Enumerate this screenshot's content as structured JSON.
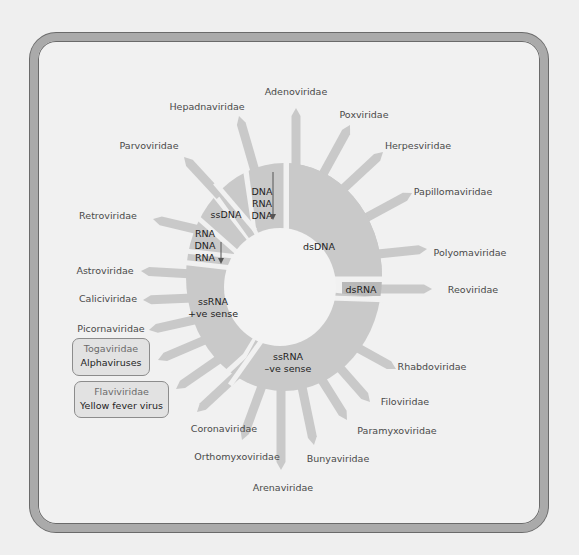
{
  "diagram": {
    "colors": {
      "background": "#efefef",
      "frame": "#aaaaaa",
      "segment": "#c9c9c9",
      "spoke": "#c9c9c9",
      "center": "#f3f3f3",
      "label": "#4a4a4a",
      "segment_text": "#1e1e1e"
    },
    "segments": [
      {
        "name": "dsDNA",
        "lines": [
          "dsDNA"
        ]
      },
      {
        "name": "DNA-RNA-DNA",
        "lines": [
          "DNA",
          "RNA",
          "DNA"
        ],
        "arrow": "down"
      },
      {
        "name": "ssDNA",
        "lines": [
          "ssDNA"
        ]
      },
      {
        "name": "RNA-DNA-RNA",
        "lines": [
          "RNA",
          "DNA",
          "RNA"
        ],
        "arrow": "down"
      },
      {
        "name": "ssRNA +ve sense",
        "lines": [
          "ssRNA",
          "+ve sense"
        ]
      },
      {
        "name": "ssRNA -ve sense",
        "lines": [
          "ssRNA",
          "–ve sense"
        ]
      },
      {
        "name": "dsRNA",
        "lines": [
          "dsRNA"
        ]
      }
    ],
    "families": [
      {
        "name": "Adenoviridae",
        "segment": "dsDNA"
      },
      {
        "name": "Poxviridae",
        "segment": "dsDNA"
      },
      {
        "name": "Herpesviridae",
        "segment": "dsDNA"
      },
      {
        "name": "Papillomaviridae",
        "segment": "dsDNA"
      },
      {
        "name": "Polyomaviridae",
        "segment": "dsDNA"
      },
      {
        "name": "Hepadnaviridae",
        "segment": "DNA-RNA-DNA"
      },
      {
        "name": "Parvoviridae",
        "segment": "ssDNA"
      },
      {
        "name": "Retroviridae",
        "segment": "RNA-DNA-RNA"
      },
      {
        "name": "Astroviridae",
        "segment": "ssRNA +ve sense"
      },
      {
        "name": "Caliciviridae",
        "segment": "ssRNA +ve sense"
      },
      {
        "name": "Picornaviridae",
        "segment": "ssRNA +ve sense"
      },
      {
        "name": "Togaviridae",
        "segment": "ssRNA +ve sense",
        "highlight": "Alphaviruses"
      },
      {
        "name": "Flaviviridae",
        "segment": "ssRNA +ve sense",
        "highlight": "Yellow fever virus"
      },
      {
        "name": "Coronaviridae",
        "segment": "ssRNA +ve sense"
      },
      {
        "name": "Orthomyxoviridae",
        "segment": "ssRNA -ve sense"
      },
      {
        "name": "Arenaviridae",
        "segment": "ssRNA -ve sense"
      },
      {
        "name": "Bunyaviridae",
        "segment": "ssRNA -ve sense"
      },
      {
        "name": "Paramyxoviridae",
        "segment": "ssRNA -ve sense"
      },
      {
        "name": "Filoviridae",
        "segment": "ssRNA -ve sense"
      },
      {
        "name": "Rhabdoviridae",
        "segment": "ssRNA -ve sense"
      },
      {
        "name": "Reoviridae",
        "segment": "dsRNA"
      }
    ],
    "boxes": [
      {
        "family": "Togaviridae",
        "example": "Alphaviruses"
      },
      {
        "family": "Flaviviridae",
        "example": "Yellow fever virus"
      }
    ]
  }
}
